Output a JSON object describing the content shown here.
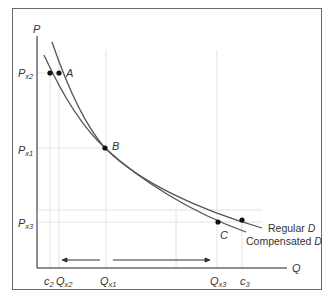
{
  "diagram": {
    "type": "economics-demand-curves",
    "axes": {
      "y_label": "P",
      "x_label": "Q"
    },
    "price_levels": [
      {
        "base": "P",
        "sub": "x2"
      },
      {
        "base": "P",
        "sub": "x1"
      },
      {
        "base": "P",
        "sub": "x3"
      }
    ],
    "quantity_ticks": [
      {
        "base": "c",
        "sub": "2"
      },
      {
        "base": "Q",
        "sub": "x2"
      },
      {
        "base": "Q",
        "sub": "x1"
      },
      {
        "base": "Q",
        "sub": "x3"
      },
      {
        "base": "c",
        "sub": "3"
      }
    ],
    "points": [
      {
        "label": "A"
      },
      {
        "label": "B"
      },
      {
        "label": "C"
      }
    ],
    "curves": [
      {
        "name": "Regular",
        "suffix": "D"
      },
      {
        "name": "Compensated",
        "suffix": "D"
      }
    ],
    "colors": {
      "curve": "#555555",
      "grid": "#e2e2e2",
      "axis": "#6a6a6a",
      "text": "#333333"
    }
  }
}
